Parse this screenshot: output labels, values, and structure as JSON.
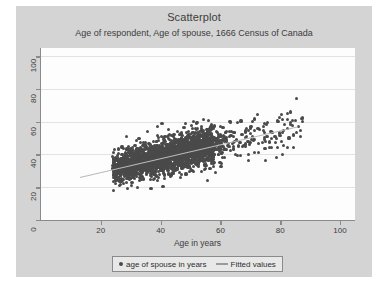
{
  "chart_data": {
    "type": "scatter",
    "title": "Scatterplot",
    "subtitle": "Age of respondent, Age of spouse, 1666 Census of Canada",
    "xlabel": "Age in years",
    "ylabel": "",
    "xlim": [
      0,
      105
    ],
    "ylim": [
      0,
      105
    ],
    "xticks": [
      "20",
      "40",
      "60",
      "80",
      "100"
    ],
    "xtick_values": [
      20,
      40,
      60,
      80,
      100
    ],
    "yticks": [
      "0",
      "20",
      "40",
      "60",
      "80",
      "100"
    ],
    "ytick_values": [
      0,
      20,
      40,
      60,
      80,
      100
    ],
    "grid": "horizontal",
    "legend_position": "bottom-outside",
    "series": [
      {
        "name": "age of spouse in years",
        "marker": "circle",
        "color": "#4a4a4a",
        "x_range": [
          15,
          88
        ],
        "y_range": [
          15,
          88
        ],
        "n_points_approx": 2600,
        "description": "Dense cloud of respondent age vs spouse age, concentrated between ages 20 and 65 along a positive diagonal band, thinning above age 70."
      },
      {
        "name": "Fitted values",
        "marker": "line",
        "color": "#b9b9b9",
        "x_start": 13,
        "y_start": 26,
        "x_end": 86,
        "y_end": 57,
        "slope": 0.425,
        "intercept": 20.5
      }
    ]
  },
  "legend": {
    "scatter_label": "age of spouse in years",
    "fit_label": "Fitted values"
  },
  "colors": {
    "background": "#d4d4d4",
    "plot_background": "#fdfdfd",
    "point": "#4a4a4a",
    "fit_line": "#b9b9b9",
    "axis": "#8a8a8a",
    "gridline": "#e2e2e2",
    "text": "#3c3c3c"
  }
}
